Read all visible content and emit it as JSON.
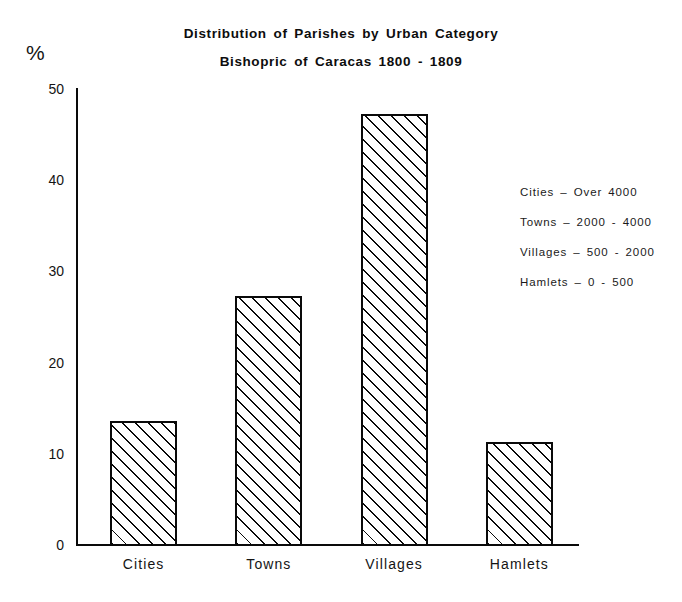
{
  "chart_data": {
    "type": "bar",
    "title": "Distribution of Parishes by Urban Category",
    "subtitle": "Bishopric of Caracas 1800 - 1809",
    "categories": [
      "Cities",
      "Towns",
      "Villages",
      "Hamlets"
    ],
    "values": [
      13.6,
      27.3,
      47.3,
      11.3
    ],
    "xlabel": "",
    "ylabel": "%",
    "ylim": [
      0,
      50
    ],
    "yticks": [
      0,
      10,
      20,
      30,
      40,
      50
    ],
    "ytick_labels": [
      "0",
      "10",
      "20",
      "30",
      "40",
      "50"
    ],
    "grid": false,
    "legend_position": "upper-right",
    "legend_entries": [
      "Cities  –  Over  4000",
      "Towns  –  2000  -  4000",
      "Villages  –  500  -  2000",
      "Hamlets  –  0  -  500"
    ],
    "bar_style": "diagonal-hatch",
    "bar_edge_color": "#0a0a0a",
    "bar_fill_color": "#ffffff",
    "background_color": "#ffffff"
  },
  "axis": {
    "percent_symbol": "%"
  },
  "legend": {
    "rows": [
      {
        "label": "Cities  –  Over  4000"
      },
      {
        "label": "Towns  –  2000  -  4000"
      },
      {
        "label": "Villages  –  500  -  2000"
      },
      {
        "label": "Hamlets  –  0  -  500"
      }
    ]
  }
}
